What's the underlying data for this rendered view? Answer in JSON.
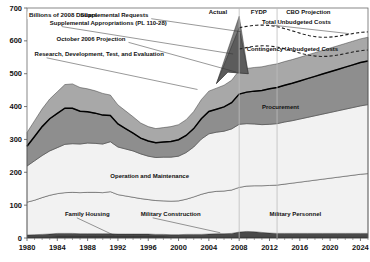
{
  "chart_data": {
    "type": "area",
    "title": "",
    "ylabel": "Billions of 2008 Dollars",
    "xlabel": "",
    "ylim": [
      0,
      700
    ],
    "xlim": [
      1980,
      2025
    ],
    "grid": false,
    "legend_position": "inline-labels",
    "y_ticks": [
      0,
      100,
      200,
      300,
      400,
      500,
      600,
      700
    ],
    "x_ticks": [
      1980,
      1984,
      1988,
      1992,
      1996,
      2000,
      2004,
      2008,
      2012,
      2016,
      2020,
      2024
    ],
    "x": [
      1980,
      1981,
      1982,
      1983,
      1984,
      1985,
      1986,
      1987,
      1988,
      1989,
      1990,
      1991,
      1992,
      1993,
      1994,
      1995,
      1996,
      1997,
      1998,
      1999,
      2000,
      2001,
      2002,
      2003,
      2004,
      2005,
      2006,
      2007,
      2008,
      2009,
      2010,
      2011,
      2012,
      2013,
      2014,
      2015,
      2016,
      2017,
      2018,
      2019,
      2020,
      2021,
      2022,
      2023,
      2024,
      2025
    ],
    "stack_order": [
      "Family Housing",
      "Military Construction",
      "Military Personnel",
      "Operation and Maintenance",
      "Procurement",
      "Research, Development, Test, and Evaluation"
    ],
    "series": [
      {
        "name": "Family Housing",
        "color": "#1a1a1a",
        "values": [
          4,
          4,
          4,
          4,
          5,
          5,
          5,
          5,
          5,
          5,
          5,
          5,
          5,
          5,
          5,
          5,
          5,
          5,
          5,
          4,
          4,
          4,
          4,
          4,
          4,
          4,
          4,
          4,
          4,
          4,
          4,
          4,
          4,
          4,
          4,
          4,
          4,
          4,
          4,
          4,
          4,
          4,
          4,
          4,
          4,
          4
        ]
      },
      {
        "name": "Military Construction",
        "color": "#4a4a4a",
        "values": [
          5,
          6,
          7,
          8,
          9,
          9,
          9,
          8,
          8,
          8,
          8,
          8,
          7,
          7,
          7,
          7,
          7,
          6,
          6,
          6,
          6,
          7,
          7,
          7,
          8,
          9,
          9,
          10,
          14,
          16,
          15,
          13,
          11,
          10,
          10,
          10,
          10,
          10,
          10,
          10,
          10,
          10,
          10,
          10,
          10,
          10
        ]
      },
      {
        "name": "Military Personnel",
        "color": "#f2f2f2",
        "values": [
          100,
          105,
          112,
          118,
          121,
          124,
          125,
          125,
          126,
          126,
          125,
          128,
          120,
          116,
          112,
          108,
          105,
          103,
          102,
          102,
          103,
          107,
          114,
          122,
          127,
          129,
          130,
          132,
          136,
          138,
          140,
          142,
          145,
          147,
          150,
          153,
          156,
          159,
          162,
          165,
          168,
          171,
          174,
          177,
          180,
          182
        ]
      },
      {
        "name": "Operation and Maintenance",
        "color": "#f2f2f2",
        "values": [
          110,
          120,
          128,
          135,
          140,
          147,
          148,
          148,
          150,
          149,
          148,
          152,
          145,
          143,
          141,
          136,
          132,
          131,
          133,
          134,
          136,
          142,
          152,
          168,
          178,
          180,
          182,
          186,
          192,
          190,
          188,
          186,
          186,
          187,
          189,
          190,
          192,
          194,
          196,
          198,
          200,
          202,
          204,
          206,
          208,
          210
        ]
      },
      {
        "name": "Procurement",
        "color": "#8e8e8e",
        "values": [
          60,
          74,
          88,
          98,
          104,
          110,
          108,
          100,
          95,
          92,
          88,
          80,
          70,
          62,
          54,
          48,
          46,
          45,
          46,
          48,
          50,
          52,
          56,
          62,
          68,
          70,
          74,
          80,
          92,
          96,
          100,
          104,
          108,
          110,
          112,
          114,
          116,
          118,
          120,
          122,
          124,
          126,
          128,
          130,
          132,
          133
        ]
      },
      {
        "name": "Research, Development, Test, and Evaluation",
        "color": "#a8a8a8",
        "values": [
          42,
          48,
          54,
          60,
          66,
          72,
          74,
          72,
          70,
          68,
          66,
          62,
          58,
          54,
          50,
          46,
          44,
          43,
          44,
          45,
          46,
          48,
          52,
          58,
          62,
          64,
          66,
          68,
          72,
          72,
          72,
          72,
          72,
          72,
          72,
          72,
          72,
          72,
          72,
          72,
          72,
          72,
          72,
          72,
          72,
          72
        ]
      }
    ],
    "overlays": [
      {
        "name": "Supplemental Appropriations (PL 110-28)",
        "type": "peak-wedge",
        "color": "#7d7d7d",
        "peak_year": 2008,
        "peak_value": 675
      },
      {
        "name": "Supplemental Requests",
        "type": "peak-wedge",
        "color": "#5c5c5c",
        "peak_year": 2008,
        "peak_value": 640
      },
      {
        "name": "October 2006 Projection",
        "type": "line",
        "peak_year": 2008,
        "peak_value": 560
      },
      {
        "name": "Total Unbudgeted Costs",
        "type": "dashed-line",
        "start_year": 2008,
        "end_year": 2025,
        "start_value": 640,
        "end_value": 615
      },
      {
        "name": "Contingency Unbudgeted Costs",
        "type": "dashed-line",
        "start_year": 2008,
        "end_year": 2025,
        "start_value": 575,
        "end_value": 560
      }
    ],
    "period_dividers": [
      {
        "label": "Actual",
        "boundary_year": 2008
      },
      {
        "label": "FYDP",
        "boundary_year": 2013
      },
      {
        "label": "CBO Projection",
        "boundary_year": 2025
      }
    ],
    "annotations": [
      {
        "text": "Billions of 2008 Dollars",
        "x": 1980,
        "y": 692
      },
      {
        "text": "Supplemental Requests",
        "x": 1996,
        "y": 672
      },
      {
        "text": "Supplemental Appropriations (PL 110-28)",
        "x": 1983,
        "y": 648
      },
      {
        "text": "October 2006 Projection",
        "x": 1993,
        "y": 600
      },
      {
        "text": "Research, Development, Test, and Evaluation",
        "x": 1981,
        "y": 553
      },
      {
        "text": "Total Unbudgeted Costs",
        "x": 2011,
        "y": 652
      },
      {
        "text": "Contingency Unbudgeted Costs",
        "x": 2009,
        "y": 570
      },
      {
        "text": "Procurement",
        "x": 2011,
        "y": 392
      },
      {
        "text": "Operation and Maintenance",
        "x": 1991,
        "y": 182
      },
      {
        "text": "Family Housing",
        "x": 1985,
        "y": 66
      },
      {
        "text": "Military Construction",
        "x": 1995,
        "y": 66
      },
      {
        "text": "Military Personnel",
        "x": 2012,
        "y": 66
      }
    ]
  },
  "axis": {
    "y_tick_0": "0",
    "y_tick_100": "100",
    "y_tick_200": "200",
    "y_tick_300": "300",
    "y_tick_400": "400",
    "y_tick_500": "500",
    "y_tick_600": "600",
    "y_tick_700": "700",
    "x_tick_1980": "1980",
    "x_tick_1984": "1984",
    "x_tick_1988": "1988",
    "x_tick_1992": "1992",
    "x_tick_1996": "1996",
    "x_tick_2000": "2000",
    "x_tick_2004": "2004",
    "x_tick_2008": "2008",
    "x_tick_2012": "2012",
    "x_tick_2016": "2016",
    "x_tick_2020": "2020",
    "x_tick_2024": "2024"
  },
  "labels": {
    "units": "Billions of 2008 Dollars",
    "period_actual": "Actual",
    "period_fydp": "FYDP",
    "period_cbo": "CBO Projection",
    "supplemental_requests": "Supplemental Requests",
    "supplemental_appropriations": "Supplemental Appropriations (PL 110-28)",
    "october_projection": "October 2006 Projection",
    "rdte": "Research, Development, Test, and Evaluation",
    "total_unbudgeted": "Total Unbudgeted Costs",
    "contingency_unbudgeted": "Contingency Unbudgeted Costs",
    "procurement": "Procurement",
    "onm": "Operation and Maintenance",
    "family_housing": "Family Housing",
    "military_construction": "Military Construction",
    "military_personnel": "Military Personnel"
  },
  "colors": {
    "rdte": "#a8a8a8",
    "procurement": "#8e8e8e",
    "onm": "#f2f2f2",
    "milpers": "#f2f2f2",
    "milcon": "#4a4a4a",
    "famhouse": "#1a1a1a",
    "supplemental_appropriations": "#7d7d7d",
    "supplemental_requests": "#5c5c5c",
    "frame": "#6a6a6a"
  }
}
